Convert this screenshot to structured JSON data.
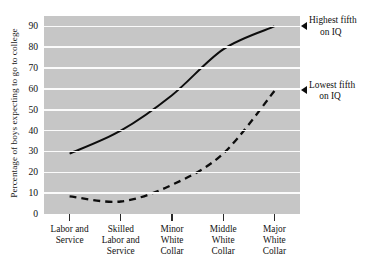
{
  "chart_data": {
    "type": "line",
    "title": "",
    "xlabel": "",
    "ylabel": "Percentage of boys expecting to go to college",
    "categories": [
      "Labor and Service",
      "Skilled Labor and Service",
      "Minor White Collar",
      "Middle White Collar",
      "Major White Collar"
    ],
    "category_lines": [
      [
        "Labor and",
        "Service"
      ],
      [
        "Skilled",
        "Labor and",
        "Service"
      ],
      [
        "Minor",
        "White",
        "Collar"
      ],
      [
        "Middle",
        "White",
        "Collar"
      ],
      [
        "Major",
        "White",
        "Collar"
      ]
    ],
    "ylim": [
      0,
      95
    ],
    "yticks": [
      0,
      10,
      20,
      30,
      40,
      50,
      60,
      70,
      80,
      90
    ],
    "ytick_labels": [
      "0",
      "10",
      "20",
      "30",
      "40",
      "50",
      "60",
      "70",
      "80",
      "90"
    ],
    "grid": true,
    "legend_position": "right-inline-annotations",
    "series": [
      {
        "name": "Highest fifth on IQ",
        "style": "solid",
        "color": "#0d0d0d",
        "values": [
          29,
          40,
          57,
          79,
          90
        ],
        "annotation_lines": [
          "Highest fifth",
          "on IQ"
        ]
      },
      {
        "name": "Lowest fifth on IQ",
        "style": "dashed",
        "color": "#0d0d0d",
        "values": [
          8.5,
          6,
          14,
          29,
          59
        ],
        "annotation_lines": [
          "Lowest fifth",
          "on IQ"
        ]
      }
    ],
    "colors": {
      "plot_background": "#c6c6c6",
      "gridline": "#fbfbfb",
      "line": "#0d0d0d",
      "text": "#111111",
      "page_background": "#ffffff"
    }
  }
}
